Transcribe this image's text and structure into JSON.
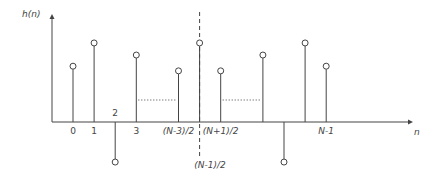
{
  "diagram": {
    "y_axis_label": "h(n)",
    "x_axis_label": "n",
    "colors": {
      "stroke": "#444444",
      "background": "#ffffff"
    },
    "samples": [
      {
        "label": "0",
        "value": 0.6,
        "italic": false
      },
      {
        "label": "1",
        "value": 0.85,
        "italic": false
      },
      {
        "label": "2",
        "value": -0.45,
        "italic": false,
        "label_above": true
      },
      {
        "label": "3",
        "value": 0.72,
        "italic": false
      },
      {
        "label": "",
        "value": null
      },
      {
        "label": "(N-3)/2",
        "value": 0.55,
        "italic": true
      },
      {
        "label": "",
        "value": 0.85,
        "center": true
      },
      {
        "label": "(N+1)/2",
        "value": 0.55,
        "italic": true
      },
      {
        "label": "",
        "value": null
      },
      {
        "label": "",
        "value": 0.72
      },
      {
        "label": "",
        "value": -0.45
      },
      {
        "label": "",
        "value": 0.85
      },
      {
        "label": "N-1",
        "value": 0.6,
        "italic": true
      }
    ],
    "center_label": "(N-1)/2",
    "ellipsis": [
      {
        "from": 3,
        "to": 5
      },
      {
        "from": 7,
        "to": 9
      }
    ]
  }
}
